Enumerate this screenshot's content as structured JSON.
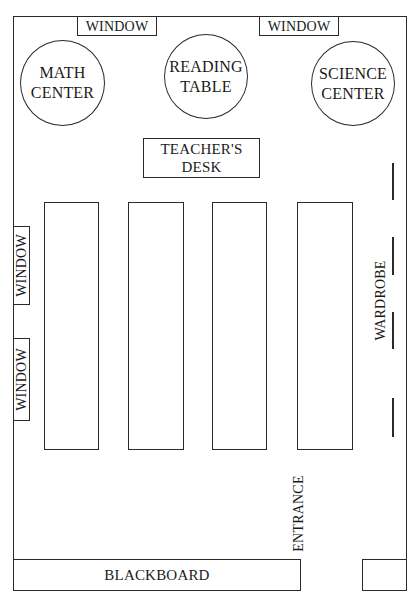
{
  "diagram": {
    "type": "classroom-floor-plan",
    "top_windows": [
      {
        "label": "WINDOW"
      },
      {
        "label": "WINDOW"
      }
    ],
    "left_windows": [
      {
        "label": "WINDOW"
      },
      {
        "label": "WINDOW"
      }
    ],
    "stations": [
      {
        "line1": "MATH",
        "line2": "CENTER"
      },
      {
        "line1": "READING",
        "line2": "TABLE"
      },
      {
        "line1": "SCIENCE",
        "line2": "CENTER"
      }
    ],
    "teacher_desk": {
      "line1": "TEACHER'S",
      "line2": "DESK"
    },
    "student_desk_rows": 4,
    "wardrobe": {
      "label": "WARDROBE"
    },
    "entrance": {
      "label": "ENTRANCE"
    },
    "blackboard": {
      "label": "BLACKBOARD"
    }
  }
}
